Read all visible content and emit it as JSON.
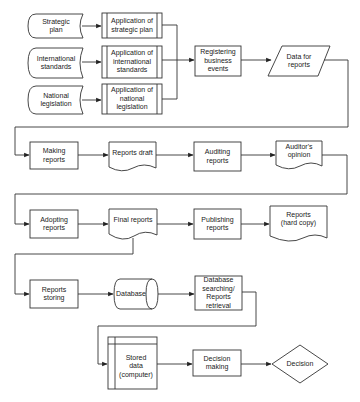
{
  "diagram": {
    "type": "flowchart",
    "nodes": {
      "strategic_plan": "Strategic\nplan",
      "international_standards": "International\nstandards",
      "national_legislation": "National\nlegislation",
      "app_strategic_plan": "Application of\nstrategic plan",
      "app_international_standards": "Application of\ninternational\nstandards",
      "app_national_legislation": "Application of\nnational\nlegislation",
      "registering_business_events": "Registering\nbusiness\nevents",
      "data_for_reports": "Data for\nreports",
      "making_reports": "Making\nreports",
      "reports_draft": "Reports draft",
      "auditing_reports": "Auditing\nreports",
      "auditors_opinion": "Auditor's\nopinion",
      "adopting_reports": "Adopting\nreports",
      "final_reports": "Final reports",
      "publishing_reports": "Publishing\nreports",
      "reports_hard_copy": "Reports\n(hard copy)",
      "reports_storing": "Reports\nstoring",
      "database": "Database",
      "database_searching": "Database\nsearching/\nReports\nretrieval",
      "stored_data_computer": "Stored\ndata\n(computer)",
      "decision_making": "Decision\nmaking",
      "decision": "Decision"
    },
    "edges": [
      [
        "strategic_plan",
        "app_strategic_plan"
      ],
      [
        "international_standards",
        "app_international_standards"
      ],
      [
        "national_legislation",
        "app_national_legislation"
      ],
      [
        "app_strategic_plan",
        "registering_business_events"
      ],
      [
        "app_international_standards",
        "registering_business_events"
      ],
      [
        "app_national_legislation",
        "registering_business_events"
      ],
      [
        "registering_business_events",
        "data_for_reports"
      ],
      [
        "data_for_reports",
        "making_reports"
      ],
      [
        "making_reports",
        "reports_draft"
      ],
      [
        "reports_draft",
        "auditing_reports"
      ],
      [
        "auditing_reports",
        "auditors_opinion"
      ],
      [
        "auditors_opinion",
        "adopting_reports"
      ],
      [
        "adopting_reports",
        "final_reports"
      ],
      [
        "final_reports",
        "publishing_reports"
      ],
      [
        "publishing_reports",
        "reports_hard_copy"
      ],
      [
        "final_reports",
        "reports_storing"
      ],
      [
        "reports_storing",
        "database"
      ],
      [
        "database",
        "database_searching"
      ],
      [
        "database_searching",
        "stored_data_computer"
      ],
      [
        "stored_data_computer",
        "decision_making"
      ],
      [
        "decision_making",
        "decision"
      ]
    ],
    "colors": {
      "stroke": "#333333",
      "text": "#222222",
      "background": "#ffffff"
    }
  }
}
